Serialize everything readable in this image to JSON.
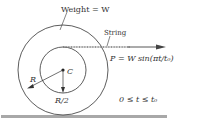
{
  "diagram": {
    "weight_label": "Weight = W",
    "string_label": "String",
    "force_label": "P = W sin(πt/t₀)",
    "center_label": "C",
    "outer_radius_label": "R",
    "inner_radius_label": "R/2",
    "time_range_label": "0 ≤ t ≤ t₀"
  },
  "colors": {
    "line": "#333333",
    "ground": "#aaaaaa"
  }
}
